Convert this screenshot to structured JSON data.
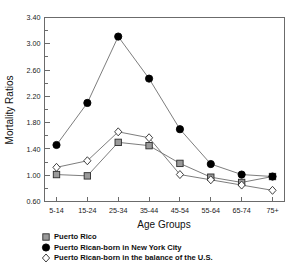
{
  "chart_data": {
    "type": "line",
    "title": "",
    "xlabel": "Age Groups",
    "ylabel": "Mortality Ratios",
    "categories": [
      "5-14",
      "15-24",
      "25-34",
      "35-44",
      "45-54",
      "55-64",
      "65-74",
      "75+"
    ],
    "ylim": [
      0.6,
      3.4
    ],
    "ytick_labels": [
      "0.60",
      "1.00",
      "1.40",
      "1.80",
      "2.20",
      "2.60",
      "3.00",
      "3.40"
    ],
    "ytick_values": [
      0.6,
      1.0,
      1.4,
      1.8,
      2.2,
      2.6,
      3.0,
      3.4
    ],
    "ytick_step": 0.4,
    "minor_ticks": true,
    "grid": false,
    "legend_position": "below-plot-left",
    "series": [
      {
        "name": "Puerto Rico",
        "marker": "square-shaded",
        "marker_color": "#9a9a9a",
        "line_color": "#6e6e6e",
        "values": [
          1.01,
          0.99,
          1.5,
          1.45,
          1.18,
          0.97,
          0.89,
          0.98
        ]
      },
      {
        "name": "Puerto Rican-born in New York City",
        "marker": "circle-filled",
        "marker_color": "#000000",
        "line_color": "#6e6e6e",
        "values": [
          1.46,
          2.1,
          3.11,
          2.47,
          1.7,
          1.17,
          1.01,
          0.98
        ]
      },
      {
        "name": "Puerto Rican-born in the balance of the U.S.",
        "marker": "diamond-open",
        "marker_color": "#ffffff",
        "line_color": "#6e6e6e",
        "values": [
          1.12,
          1.22,
          1.66,
          1.57,
          1.01,
          0.93,
          0.85,
          0.77
        ]
      }
    ]
  },
  "legend": {
    "items": [
      {
        "label": "Puerto Rico",
        "marker": "square-shaded"
      },
      {
        "label": "Puerto Rican-born in New York City",
        "marker": "circle-filled"
      },
      {
        "label": "Puerto Rican-born in the balance of the U.S.",
        "marker": "diamond-open"
      }
    ]
  }
}
